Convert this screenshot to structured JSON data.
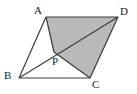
{
  "figure": {
    "kind": "geometry-diagram",
    "background_color": "#ffffff",
    "shade_color": "#b9b9b9",
    "stroke_color": "#3b3b3b",
    "stroke_width": 1.2,
    "label_color": "#1a1a1a",
    "viewbox": {
      "width": 137,
      "height": 94
    },
    "points": {
      "A": {
        "x": 46,
        "y": 17
      },
      "B": {
        "x": 19,
        "y": 78
      },
      "C": {
        "x": 90,
        "y": 78
      },
      "D": {
        "x": 118,
        "y": 17
      },
      "P": {
        "x": 54,
        "y": 52
      }
    },
    "shaded_polygon": "46,17 118,17 90,78 54,52",
    "edges": [
      {
        "name": "edge-AD",
        "from": "A",
        "to": "D"
      },
      {
        "name": "edge-DC",
        "from": "D",
        "to": "C"
      },
      {
        "name": "edge-CB",
        "from": "C",
        "to": "B"
      },
      {
        "name": "edge-BA",
        "from": "B",
        "to": "A"
      },
      {
        "name": "segment-AP",
        "from": "A",
        "to": "P"
      },
      {
        "name": "segment-PC",
        "from": "P",
        "to": "C"
      },
      {
        "name": "diagonal-BD",
        "from": "B",
        "to": "D"
      }
    ],
    "labels": [
      {
        "name": "label-A",
        "text": "A",
        "x": 34,
        "y": 5
      },
      {
        "name": "label-D",
        "text": "D",
        "x": 120,
        "y": 6
      },
      {
        "name": "label-B",
        "text": "B",
        "x": 4,
        "y": 70
      },
      {
        "name": "label-C",
        "text": "C",
        "x": 92,
        "y": 79
      },
      {
        "name": "label-P",
        "text": "P",
        "x": 52,
        "y": 56
      }
    ]
  }
}
